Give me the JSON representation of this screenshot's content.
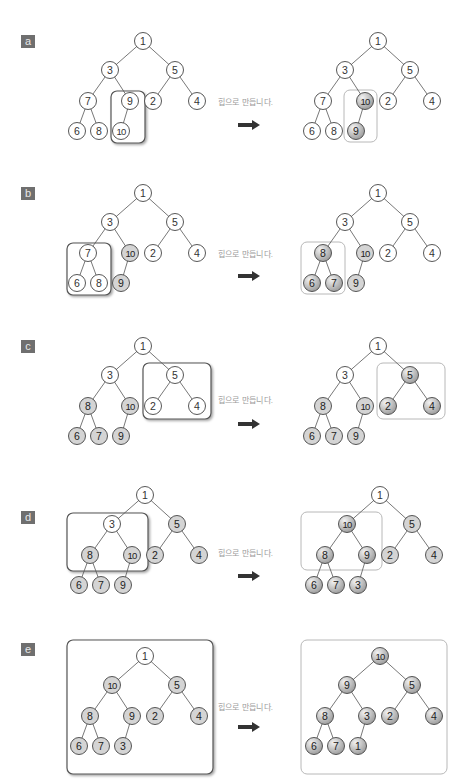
{
  "caption": "힙으로 만듭니다.",
  "colors": {
    "node_plain": "#ffffff",
    "node_done": "#d4d4d4",
    "node_active": "#9a9a9a",
    "edge": "#555555",
    "box_dark": "#555555",
    "box_light": "#b8b8b8",
    "label_bg": "#6f6f6f",
    "caption": "#9a9a9a",
    "arrow": "#333333"
  },
  "panels": [
    {
      "label": "a",
      "before": {
        "nodes": [
          "1",
          "3",
          "5",
          "7",
          "9",
          "2",
          "4",
          "6",
          "8",
          "10"
        ],
        "states": [
          "p",
          "p",
          "p",
          "p",
          "p",
          "p",
          "p",
          "p",
          "p",
          "p"
        ],
        "highlight": [
          4,
          9
        ]
      },
      "after": {
        "nodes": [
          "1",
          "3",
          "5",
          "7",
          "10",
          "2",
          "4",
          "6",
          "8",
          "9"
        ],
        "states": [
          "p",
          "p",
          "p",
          "p",
          "a",
          "p",
          "p",
          "p",
          "p",
          "a"
        ],
        "highlight": [
          4,
          9
        ]
      }
    },
    {
      "label": "b",
      "before": {
        "nodes": [
          "1",
          "3",
          "5",
          "7",
          "10",
          "2",
          "4",
          "6",
          "8",
          "9"
        ],
        "states": [
          "p",
          "p",
          "p",
          "p",
          "d",
          "p",
          "p",
          "p",
          "p",
          "d"
        ],
        "highlight": [
          3,
          7,
          8
        ]
      },
      "after": {
        "nodes": [
          "1",
          "3",
          "5",
          "8",
          "10",
          "2",
          "4",
          "6",
          "7",
          "9"
        ],
        "states": [
          "p",
          "p",
          "p",
          "a",
          "d",
          "p",
          "p",
          "a",
          "a",
          "d"
        ],
        "highlight": [
          3,
          7,
          8
        ]
      }
    },
    {
      "label": "c",
      "before": {
        "nodes": [
          "1",
          "3",
          "5",
          "8",
          "10",
          "2",
          "4",
          "6",
          "7",
          "9"
        ],
        "states": [
          "p",
          "p",
          "p",
          "d",
          "d",
          "p",
          "p",
          "d",
          "d",
          "d"
        ],
        "highlight": [
          2,
          5,
          6
        ]
      },
      "after": {
        "nodes": [
          "1",
          "3",
          "5",
          "8",
          "10",
          "2",
          "4",
          "6",
          "7",
          "9"
        ],
        "states": [
          "p",
          "p",
          "a",
          "d",
          "d",
          "a",
          "a",
          "d",
          "d",
          "d"
        ],
        "highlight": [
          2,
          5,
          6
        ]
      }
    },
    {
      "label": "d",
      "before": {
        "nodes": [
          "1",
          "3",
          "5",
          "8",
          "10",
          "2",
          "4",
          "6",
          "7",
          "9"
        ],
        "states": [
          "p",
          "p",
          "d",
          "d",
          "d",
          "d",
          "d",
          "d",
          "d",
          "d"
        ],
        "highlight": [
          1,
          3,
          4,
          7,
          8,
          9
        ]
      },
      "after": {
        "nodes": [
          "1",
          "10",
          "5",
          "8",
          "9",
          "2",
          "4",
          "6",
          "7",
          "3"
        ],
        "states": [
          "p",
          "a",
          "d",
          "a",
          "a",
          "d",
          "d",
          "a",
          "a",
          "a"
        ],
        "highlight": [
          1,
          3,
          4,
          7,
          8,
          9
        ]
      }
    },
    {
      "label": "e",
      "before": {
        "nodes": [
          "1",
          "10",
          "5",
          "8",
          "9",
          "2",
          "4",
          "6",
          "7",
          "3"
        ],
        "states": [
          "p",
          "d",
          "d",
          "d",
          "d",
          "d",
          "d",
          "d",
          "d",
          "d"
        ],
        "highlight": [
          0,
          1,
          2,
          3,
          4,
          5,
          6,
          7,
          8,
          9
        ]
      },
      "after": {
        "nodes": [
          "10",
          "9",
          "5",
          "8",
          "3",
          "2",
          "4",
          "6",
          "7",
          "1"
        ],
        "states": [
          "a",
          "a",
          "a",
          "a",
          "a",
          "a",
          "a",
          "a",
          "a",
          "a"
        ],
        "highlight": [
          0,
          1,
          2,
          3,
          4,
          5,
          6,
          7,
          8,
          9
        ]
      }
    }
  ]
}
